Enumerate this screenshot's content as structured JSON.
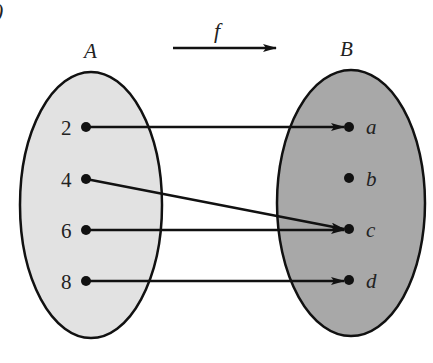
{
  "diagram": {
    "corner_mark": ")",
    "function_label": "f",
    "domain": {
      "label": "A",
      "fill": "#e2e2e2",
      "elements": [
        "2",
        "4",
        "6",
        "8"
      ]
    },
    "codomain": {
      "label": "B",
      "fill": "#a8a8a8",
      "elements": [
        "a",
        "b",
        "c",
        "d"
      ]
    },
    "mappings": [
      {
        "from": "2",
        "to": "a"
      },
      {
        "from": "4",
        "to": "c"
      },
      {
        "from": "6",
        "to": "c"
      },
      {
        "from": "8",
        "to": "d"
      }
    ],
    "stroke": "#111111"
  }
}
